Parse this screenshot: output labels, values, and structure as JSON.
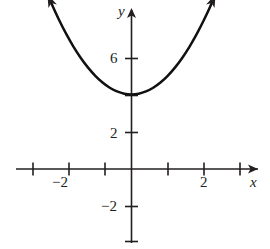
{
  "figure": {
    "background_color": "#ffffff",
    "ink_color": "#231f20",
    "curve_color": "#111111"
  },
  "axes": {
    "x_axis_label": "x",
    "y_axis_label": "y",
    "x_tick_labels": [
      {
        "value": -2,
        "text": "−2"
      },
      {
        "value": 2,
        "text": "2"
      }
    ],
    "y_tick_labels": [
      {
        "value": 6,
        "text": "6"
      },
      {
        "value": 2,
        "text": "2"
      },
      {
        "value": -2,
        "text": "−2"
      }
    ]
  },
  "chart_data": {
    "type": "line",
    "title": "",
    "subtitle": "",
    "xlabel": "x",
    "ylabel": "y",
    "xlim": [
      -2.7,
      3.0
    ],
    "ylim": [
      -3.6,
      9.7
    ],
    "grid": false,
    "legend": null,
    "annotations": [],
    "x_ticks": [
      -3,
      -2,
      -1,
      0,
      1,
      2,
      3
    ],
    "x_ticks_labeled": [
      -2,
      2
    ],
    "y_ticks": [
      -2,
      2,
      6,
      8
    ],
    "y_ticks_labeled": [
      -2,
      2,
      6
    ],
    "series": [
      {
        "name": "y = x^2 + 4",
        "equation": "y = x² + 4",
        "vertex": [
          0,
          4
        ],
        "opens": "up",
        "arrow_start": true,
        "arrow_end": true,
        "x": [
          -2.3,
          -2.1,
          -1.9,
          -1.7,
          -1.5,
          -1.3,
          -1.1,
          -0.9,
          -0.7,
          -0.5,
          -0.3,
          -0.1,
          0.1,
          0.3,
          0.5,
          0.7,
          0.9,
          1.1,
          1.3,
          1.5,
          1.7,
          1.9,
          2.1,
          2.3
        ],
        "values": [
          9.29,
          8.41,
          7.61,
          6.89,
          6.25,
          5.69,
          5.21,
          4.81,
          4.49,
          4.25,
          4.09,
          4.01,
          4.01,
          4.09,
          4.25,
          4.49,
          4.81,
          5.21,
          5.69,
          6.25,
          6.89,
          7.61,
          8.41,
          9.29
        ]
      }
    ]
  }
}
